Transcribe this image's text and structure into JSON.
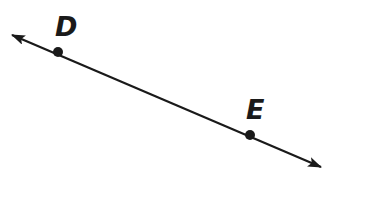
{
  "diagram": {
    "type": "line",
    "stroke_color": "#1a1a1a",
    "line": {
      "start": [
        12,
        35
      ],
      "end": [
        321,
        167
      ],
      "arrow_at_start": true,
      "arrow_at_end": true
    },
    "points": [
      {
        "label": "D",
        "x": 58,
        "y": 52,
        "label_x": 55,
        "label_y": 36
      },
      {
        "label": "E",
        "x": 250,
        "y": 135,
        "label_x": 246,
        "label_y": 119
      }
    ]
  }
}
